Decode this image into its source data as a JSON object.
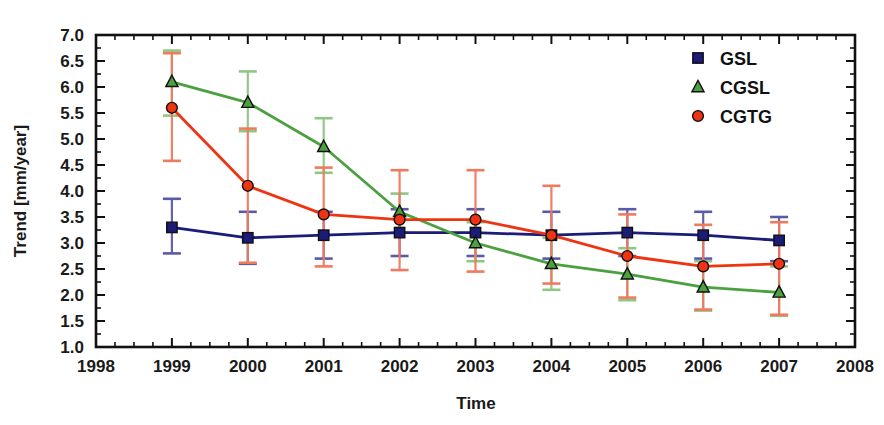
{
  "chart_data": {
    "type": "line",
    "title": "",
    "xlabel": "Time",
    "ylabel": "Trend [mm/year]",
    "xlim": [
      1998,
      2008
    ],
    "ylim": [
      1.0,
      7.0
    ],
    "grid": false,
    "legend_position": "top-right",
    "x": [
      1999,
      2000,
      2001,
      2002,
      2003,
      2004,
      2005,
      2006,
      2007
    ],
    "xticks": [
      "1998",
      "1999",
      "2000",
      "2001",
      "2002",
      "2003",
      "2004",
      "2005",
      "2006",
      "2007",
      "2008"
    ],
    "yticks": [
      "1.0",
      "1.5",
      "2.0",
      "2.5",
      "3.0",
      "3.5",
      "4.0",
      "4.5",
      "5.0",
      "5.5",
      "6.0",
      "6.5",
      "7.0"
    ],
    "series": [
      {
        "name": "GSL",
        "color": "#1b1b78",
        "marker": "square",
        "values": [
          3.3,
          3.1,
          3.15,
          3.2,
          3.2,
          3.15,
          3.2,
          3.15,
          3.05
        ],
        "err_low": [
          2.8,
          2.6,
          2.7,
          2.75,
          2.75,
          2.7,
          2.75,
          2.7,
          2.65
        ],
        "err_high": [
          3.85,
          3.6,
          3.6,
          3.65,
          3.65,
          3.6,
          3.65,
          3.6,
          3.5
        ]
      },
      {
        "name": "CGSL",
        "color": "#4ba03f",
        "marker": "triangle",
        "values": [
          6.1,
          5.7,
          4.85,
          3.6,
          3.0,
          2.6,
          2.4,
          2.15,
          2.05
        ],
        "err_low": [
          5.45,
          5.15,
          4.35,
          3.2,
          2.65,
          2.1,
          1.9,
          1.7,
          1.6
        ],
        "err_high": [
          6.7,
          6.3,
          5.4,
          3.95,
          3.4,
          3.1,
          2.9,
          2.65,
          2.55
        ]
      },
      {
        "name": "CGTG",
        "color": "#ee3412",
        "marker": "circle",
        "values": [
          5.6,
          4.1,
          3.55,
          3.45,
          3.45,
          3.15,
          2.75,
          2.55,
          2.6
        ],
        "err_low": [
          4.58,
          2.62,
          2.55,
          2.48,
          2.45,
          2.22,
          1.95,
          1.72,
          1.62
        ],
        "err_high": [
          6.65,
          5.2,
          4.45,
          4.4,
          4.4,
          4.1,
          3.55,
          3.35,
          3.4
        ]
      }
    ]
  },
  "legend": {
    "items": [
      {
        "label": "GSL",
        "color": "#1b1b78",
        "marker": "square"
      },
      {
        "label": "CGSL",
        "color": "#4ba03f",
        "marker": "triangle"
      },
      {
        "label": "CGTG",
        "color": "#ee3412",
        "marker": "circle"
      }
    ]
  },
  "axes": {
    "x_title": "Time",
    "y_title": "Trend [mm/year]"
  }
}
